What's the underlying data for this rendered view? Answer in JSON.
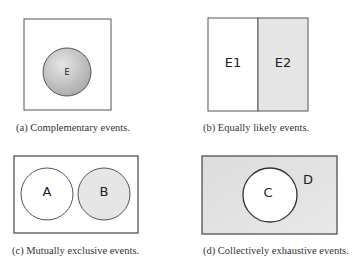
{
  "colors": {
    "border": "#555555",
    "shade_dark": "#bdbdbd",
    "shade_light": "#e4e4e4",
    "white": "#ffffff"
  },
  "panels": [
    {
      "id": "a",
      "caption": "(a) Complementary events.",
      "labels": [
        "E"
      ]
    },
    {
      "id": "b",
      "caption": "(b) Equally likely events.",
      "labels": [
        "E1",
        "E2"
      ]
    },
    {
      "id": "c",
      "caption": "(c) Mutually exclusive events.",
      "labels": [
        "A",
        "B"
      ]
    },
    {
      "id": "d",
      "caption": "(d) Collectively exhaustive events.",
      "labels": [
        "C",
        "D"
      ]
    }
  ]
}
